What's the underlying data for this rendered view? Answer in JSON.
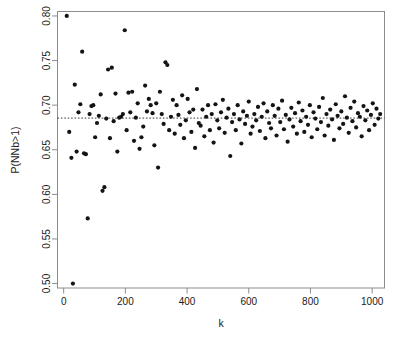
{
  "chart_data": {
    "type": "scatter",
    "title": "",
    "subtitle": "",
    "xlabel": "k",
    "ylabel": "P(NNb>1)",
    "xlim": [
      -20,
      1040
    ],
    "ylim": [
      0.495,
      0.805
    ],
    "xticks": [
      0,
      200,
      400,
      600,
      800,
      1000
    ],
    "xtick_labels": [
      "0",
      "200",
      "400",
      "600",
      "800",
      "1000"
    ],
    "yticks": [
      0.5,
      0.55,
      0.6,
      0.65,
      0.7,
      0.75,
      0.8
    ],
    "ytick_labels": [
      "0.50",
      "0.55",
      "0.60",
      "0.65",
      "0.70",
      "0.75",
      "0.80"
    ],
    "grid": false,
    "legend": null,
    "point_color": "#141414",
    "point_radius": 2.1,
    "frame_color": "#8c8c8c",
    "reference_line": {
      "type": "horizontal",
      "y": 0.6855,
      "style": "dashed",
      "color": "#3a3a3a",
      "label": ""
    },
    "x": [
      10,
      18,
      25,
      30,
      36,
      42,
      48,
      54,
      60,
      66,
      72,
      78,
      84,
      90,
      96,
      102,
      108,
      114,
      120,
      126,
      132,
      138,
      144,
      150,
      156,
      162,
      168,
      174,
      180,
      186,
      192,
      198,
      204,
      210,
      216,
      222,
      228,
      234,
      240,
      246,
      252,
      258,
      264,
      270,
      276,
      282,
      288,
      294,
      300,
      306,
      312,
      318,
      324,
      330,
      336,
      342,
      348,
      354,
      360,
      366,
      372,
      378,
      384,
      390,
      396,
      402,
      408,
      414,
      420,
      426,
      432,
      438,
      444,
      450,
      456,
      462,
      468,
      474,
      480,
      486,
      492,
      498,
      504,
      510,
      516,
      522,
      528,
      534,
      540,
      546,
      552,
      558,
      564,
      570,
      576,
      582,
      588,
      594,
      600,
      606,
      612,
      618,
      624,
      630,
      636,
      642,
      648,
      654,
      660,
      666,
      672,
      678,
      684,
      690,
      696,
      702,
      708,
      714,
      720,
      726,
      732,
      738,
      744,
      750,
      756,
      762,
      768,
      774,
      780,
      786,
      792,
      798,
      804,
      810,
      816,
      822,
      828,
      834,
      840,
      846,
      852,
      858,
      864,
      870,
      876,
      882,
      888,
      894,
      900,
      906,
      912,
      918,
      924,
      930,
      936,
      942,
      948,
      954,
      960,
      966,
      972,
      978,
      984,
      990,
      996,
      1002,
      1008,
      1014,
      1020,
      1026
    ],
    "y": [
      0.8,
      0.67,
      0.641,
      0.5,
      0.723,
      0.648,
      0.692,
      0.701,
      0.76,
      0.646,
      0.645,
      0.573,
      0.69,
      0.699,
      0.7,
      0.664,
      0.68,
      0.688,
      0.712,
      0.604,
      0.608,
      0.685,
      0.74,
      0.663,
      0.742,
      0.682,
      0.713,
      0.648,
      0.686,
      0.687,
      0.69,
      0.784,
      0.672,
      0.714,
      0.692,
      0.715,
      0.66,
      0.686,
      0.702,
      0.651,
      0.664,
      0.676,
      0.722,
      0.693,
      0.707,
      0.7,
      0.691,
      0.655,
      0.702,
      0.63,
      0.715,
      0.69,
      0.679,
      0.748,
      0.745,
      0.672,
      0.687,
      0.706,
      0.668,
      0.7,
      0.689,
      0.678,
      0.711,
      0.663,
      0.683,
      0.707,
      0.692,
      0.67,
      0.695,
      0.652,
      0.718,
      0.68,
      0.677,
      0.695,
      0.665,
      0.687,
      0.7,
      0.672,
      0.69,
      0.658,
      0.701,
      0.683,
      0.674,
      0.692,
      0.706,
      0.669,
      0.686,
      0.696,
      0.643,
      0.681,
      0.69,
      0.672,
      0.7,
      0.684,
      0.657,
      0.693,
      0.679,
      0.688,
      0.704,
      0.668,
      0.676,
      0.69,
      0.683,
      0.698,
      0.671,
      0.687,
      0.702,
      0.663,
      0.693,
      0.68,
      0.674,
      0.7,
      0.688,
      0.666,
      0.696,
      0.681,
      0.705,
      0.673,
      0.689,
      0.659,
      0.684,
      0.697,
      0.676,
      0.691,
      0.668,
      0.703,
      0.682,
      0.694,
      0.67,
      0.687,
      0.678,
      0.7,
      0.664,
      0.692,
      0.685,
      0.673,
      0.698,
      0.681,
      0.708,
      0.666,
      0.69,
      0.677,
      0.695,
      0.684,
      0.661,
      0.701,
      0.688,
      0.674,
      0.693,
      0.679,
      0.71,
      0.686,
      0.669,
      0.697,
      0.682,
      0.704,
      0.675,
      0.691,
      0.687,
      0.665,
      0.699,
      0.683,
      0.694,
      0.672,
      0.689,
      0.702,
      0.678,
      0.696,
      0.685,
      0.69
    ]
  },
  "axes": {
    "x_axis_name": "k-axis",
    "y_axis_name": "probability-axis"
  }
}
